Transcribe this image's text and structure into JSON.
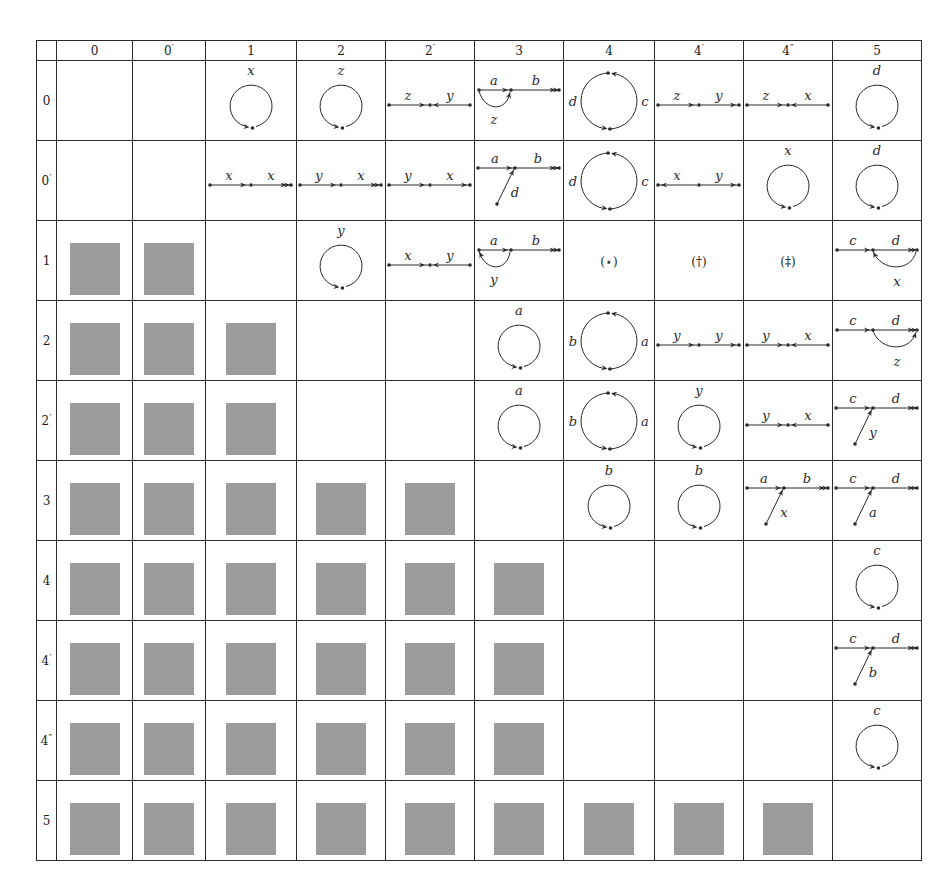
{
  "header": {
    "corner": "",
    "columns": [
      {
        "id": "0",
        "base": "0",
        "prime": ""
      },
      {
        "id": "0p",
        "base": "0",
        "prime": "′"
      },
      {
        "id": "1",
        "base": "1",
        "prime": ""
      },
      {
        "id": "2",
        "base": "2",
        "prime": ""
      },
      {
        "id": "2p",
        "base": "2",
        "prime": "′"
      },
      {
        "id": "3",
        "base": "3",
        "prime": ""
      },
      {
        "id": "4",
        "base": "4",
        "prime": ""
      },
      {
        "id": "4p",
        "base": "4",
        "prime": "′"
      },
      {
        "id": "4pp",
        "base": "4",
        "prime": "″"
      },
      {
        "id": "5",
        "base": "5",
        "prime": ""
      }
    ]
  },
  "rows": [
    {
      "base": "0",
      "prime": "",
      "cells": [
        {
          "type": "empty"
        },
        {
          "type": "empty"
        },
        {
          "type": "loop",
          "label": "x"
        },
        {
          "type": "loop",
          "label": "z"
        },
        {
          "type": "converge",
          "left": "z",
          "right": "y"
        },
        {
          "type": "arc-fork",
          "top": "a",
          "right": "b",
          "arc": "z",
          "arcDir": "forward"
        },
        {
          "type": "two-loop",
          "left": "d",
          "right": "c"
        },
        {
          "type": "chain",
          "left": "z",
          "right": "y"
        },
        {
          "type": "converge",
          "left": "z",
          "right": "x"
        },
        {
          "type": "loop",
          "label": "d"
        }
      ]
    },
    {
      "base": "0",
      "prime": "′",
      "cells": [
        {
          "type": "empty"
        },
        {
          "type": "empty"
        },
        {
          "type": "chain-double",
          "left": "x",
          "right": "x"
        },
        {
          "type": "chain-double",
          "left": "y",
          "right": "x"
        },
        {
          "type": "chain",
          "left": "y",
          "right": "x"
        },
        {
          "type": "join",
          "left": "a",
          "right": "b",
          "diag": "d"
        },
        {
          "type": "two-loop",
          "left": "d",
          "right": "c"
        },
        {
          "type": "diverge",
          "left": "x",
          "right": "y"
        },
        {
          "type": "loop",
          "label": "x"
        },
        {
          "type": "loop",
          "label": "d"
        }
      ]
    },
    {
      "base": "1",
      "prime": "",
      "cells": [
        {
          "type": "gray"
        },
        {
          "type": "gray"
        },
        {
          "type": "empty"
        },
        {
          "type": "loop",
          "label": "y"
        },
        {
          "type": "converge",
          "left": "x",
          "right": "y"
        },
        {
          "type": "arc-fork",
          "top": "a",
          "right": "b",
          "arc": "y",
          "arcDir": "back"
        },
        {
          "type": "symbol",
          "text": "(⋆)"
        },
        {
          "type": "symbol",
          "text": "(†)"
        },
        {
          "type": "symbol",
          "text": "(‡)"
        },
        {
          "type": "arc-fork-right",
          "left": "c",
          "top": "d",
          "arc": "x",
          "arcDir": "back"
        }
      ]
    },
    {
      "base": "2",
      "prime": "",
      "cells": [
        {
          "type": "gray"
        },
        {
          "type": "gray"
        },
        {
          "type": "gray"
        },
        {
          "type": "empty"
        },
        {
          "type": "empty"
        },
        {
          "type": "loop",
          "label": "a"
        },
        {
          "type": "two-loop",
          "left": "b",
          "right": "a"
        },
        {
          "type": "chain",
          "left": "y",
          "right": "y"
        },
        {
          "type": "converge",
          "left": "y",
          "right": "x"
        },
        {
          "type": "arc-fork-right",
          "left": "c",
          "top": "d",
          "arc": "z",
          "arcDir": "forward"
        }
      ]
    },
    {
      "base": "2",
      "prime": "′",
      "cells": [
        {
          "type": "gray"
        },
        {
          "type": "gray"
        },
        {
          "type": "gray"
        },
        {
          "type": "empty"
        },
        {
          "type": "empty"
        },
        {
          "type": "loop",
          "label": "a"
        },
        {
          "type": "two-loop",
          "left": "b",
          "right": "a"
        },
        {
          "type": "loop",
          "label": "y"
        },
        {
          "type": "converge",
          "left": "y",
          "right": "x"
        },
        {
          "type": "join",
          "left": "c",
          "right": "d",
          "diag": "y"
        }
      ]
    },
    {
      "base": "3",
      "prime": "",
      "cells": [
        {
          "type": "gray"
        },
        {
          "type": "gray"
        },
        {
          "type": "gray"
        },
        {
          "type": "gray"
        },
        {
          "type": "gray"
        },
        {
          "type": "empty"
        },
        {
          "type": "loop",
          "label": "b"
        },
        {
          "type": "loop",
          "label": "b"
        },
        {
          "type": "join",
          "left": "a",
          "right": "b",
          "diag": "x"
        },
        {
          "type": "join",
          "left": "c",
          "right": "d",
          "diag": "a"
        }
      ]
    },
    {
      "base": "4",
      "prime": "",
      "cells": [
        {
          "type": "gray"
        },
        {
          "type": "gray"
        },
        {
          "type": "gray"
        },
        {
          "type": "gray"
        },
        {
          "type": "gray"
        },
        {
          "type": "gray"
        },
        {
          "type": "empty"
        },
        {
          "type": "empty"
        },
        {
          "type": "empty"
        },
        {
          "type": "loop",
          "label": "c"
        }
      ]
    },
    {
      "base": "4",
      "prime": "′",
      "cells": [
        {
          "type": "gray"
        },
        {
          "type": "gray"
        },
        {
          "type": "gray"
        },
        {
          "type": "gray"
        },
        {
          "type": "gray"
        },
        {
          "type": "gray"
        },
        {
          "type": "empty"
        },
        {
          "type": "empty"
        },
        {
          "type": "empty"
        },
        {
          "type": "join",
          "left": "c",
          "right": "d",
          "diag": "b"
        }
      ]
    },
    {
      "base": "4",
      "prime": "″",
      "cells": [
        {
          "type": "gray"
        },
        {
          "type": "gray"
        },
        {
          "type": "gray"
        },
        {
          "type": "gray"
        },
        {
          "type": "gray"
        },
        {
          "type": "gray"
        },
        {
          "type": "empty"
        },
        {
          "type": "empty"
        },
        {
          "type": "empty"
        },
        {
          "type": "loop",
          "label": "c"
        }
      ]
    },
    {
      "base": "5",
      "prime": "",
      "cells": [
        {
          "type": "gray"
        },
        {
          "type": "gray"
        },
        {
          "type": "gray"
        },
        {
          "type": "gray"
        },
        {
          "type": "gray"
        },
        {
          "type": "gray"
        },
        {
          "type": "gray"
        },
        {
          "type": "gray"
        },
        {
          "type": "gray"
        },
        {
          "type": "empty"
        }
      ]
    }
  ],
  "colors": {
    "line": "#2a2a2a",
    "gray_block": "#9b9b9b",
    "background": "#ffffff"
  },
  "layout": {
    "col_widths": [
      20,
      76,
      73,
      91,
      88,
      89,
      89,
      91,
      89,
      87,
      87
    ]
  }
}
